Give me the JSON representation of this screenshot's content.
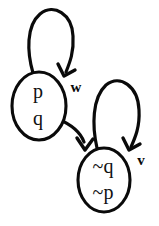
{
  "diagram": {
    "type": "state-transition-diagram",
    "background_color": "#ffffff",
    "stroke_color": "#0a0a0a",
    "text_color": "#111111",
    "states": [
      {
        "id": "state-left",
        "name": "state-p-q",
        "propositions": [
          "p",
          "q"
        ],
        "line1": "p",
        "line2": "q",
        "cx": 39,
        "cy": 106,
        "rx": 27,
        "ry": 34
      },
      {
        "id": "state-right",
        "name": "state-not-q-not-p",
        "propositions": [
          "~q",
          "~p"
        ],
        "line1": "~q",
        "line2": "~p",
        "cx": 104,
        "cy": 180,
        "rx": 26,
        "ry": 32
      }
    ],
    "edges": [
      {
        "id": "edge-self-left",
        "kind": "self-loop",
        "from": "state-left",
        "to": "state-left",
        "label": "w",
        "label_x": 75,
        "label_y": 88
      },
      {
        "id": "edge-left-to-right",
        "kind": "transition",
        "from": "state-left",
        "to": "state-right",
        "label": ""
      },
      {
        "id": "edge-self-right",
        "kind": "self-loop",
        "from": "state-right",
        "to": "state-right",
        "label": "v",
        "label_x": 141,
        "label_y": 161
      }
    ]
  }
}
